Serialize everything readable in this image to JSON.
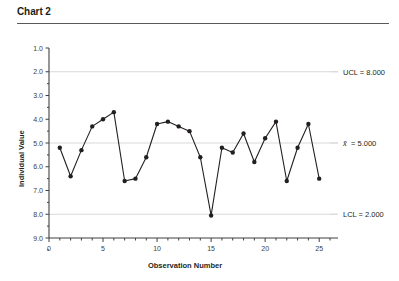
{
  "chart_title": "Chart 2",
  "axis": {
    "ylabel": "Individual Value",
    "xlabel": "Observation Number",
    "ytick_labels": [
      "9.0",
      "8.0",
      "7.0",
      "6.0",
      "5.0",
      "4.0",
      "3.0",
      "2.0",
      "1.0"
    ],
    "xtick_labels": [
      "0",
      "5",
      "10",
      "15",
      "20",
      "25"
    ]
  },
  "limits": {
    "ucl_label": "UCL = 8.000",
    "center_label_value": "= 5.000",
    "center_label_symbol": "x",
    "lcl_label": "LCL = 2.000"
  },
  "colors": {
    "series": "#231f20",
    "gridline": "#d9d9d9",
    "axis": "#414042",
    "rule": "#58595b",
    "background": "#ffffff"
  },
  "chart_data": {
    "type": "line",
    "title": "Chart 2",
    "xlabel": "Observation Number",
    "ylabel": "Individual Value",
    "xlim": [
      0,
      26
    ],
    "ylim": [
      1.0,
      9.0
    ],
    "xticks": [
      0,
      5,
      10,
      15,
      20,
      25
    ],
    "yticks": [
      1.0,
      2.0,
      3.0,
      4.0,
      5.0,
      6.0,
      7.0,
      8.0,
      9.0
    ],
    "grid": false,
    "legend": "none",
    "markers": "filled-circle",
    "series": [
      {
        "name": "Individual Value",
        "x": [
          1,
          2,
          3,
          4,
          5,
          6,
          7,
          8,
          9,
          10,
          11,
          12,
          13,
          14,
          15,
          16,
          17,
          18,
          19,
          20,
          21,
          22,
          23,
          24,
          25
        ],
        "values": [
          4.8,
          3.6,
          4.7,
          5.7,
          6.0,
          6.3,
          3.4,
          3.5,
          4.4,
          5.8,
          5.9,
          5.7,
          5.5,
          4.4,
          1.95,
          4.8,
          4.6,
          5.4,
          4.2,
          5.2,
          5.9,
          3.4,
          4.8,
          5.8,
          3.5
        ]
      }
    ],
    "reference_lines": [
      {
        "name": "UCL",
        "value": 8.0,
        "label": "UCL = 8.000"
      },
      {
        "name": "CL",
        "value": 5.0,
        "label": "x̄ = 5.000"
      },
      {
        "name": "LCL",
        "value": 2.0,
        "label": "LCL = 2.000"
      }
    ]
  }
}
